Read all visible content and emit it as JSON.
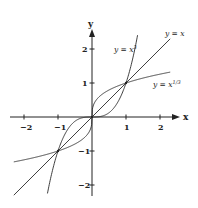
{
  "chart_data": {
    "type": "line",
    "title": "",
    "xlabel": "x",
    "ylabel": "y",
    "xlim": [
      -2.3,
      2.3
    ],
    "ylim": [
      -2.3,
      2.3
    ],
    "xticks": [
      -2,
      -1,
      1,
      2
    ],
    "yticks": [
      2,
      1,
      -1,
      -2
    ],
    "grid": false,
    "legend": "inline labels near curves",
    "series": [
      {
        "name": "y = x^3",
        "label": "y = x³",
        "function": "x^3"
      },
      {
        "name": "y = x",
        "label": "y = x",
        "function": "x"
      },
      {
        "name": "y = x^(1/3)",
        "label": "y = x^{1/3}",
        "function": "cbrt(x)"
      }
    ],
    "intersections": [
      [
        -1,
        -1
      ],
      [
        0,
        0
      ],
      [
        1,
        1
      ]
    ]
  },
  "axes": {
    "x_label": "x",
    "y_label": "y",
    "x_tick_labels": [
      "−2",
      "−1",
      "1",
      "2"
    ],
    "y_tick_labels": [
      "2",
      "1",
      "−1",
      "−2"
    ]
  },
  "labels": {
    "cube": {
      "base": "y = x",
      "sup": "3"
    },
    "identity": {
      "text": "y = x"
    },
    "cuberoot": {
      "base": "y = x",
      "sup": "1/3"
    }
  },
  "colors": {
    "curve": "#2a2a2a",
    "axis": "#222222",
    "background": "#ffffff"
  }
}
